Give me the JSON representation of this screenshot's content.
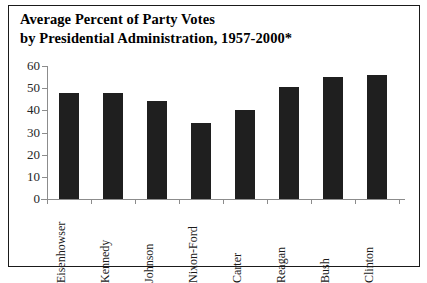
{
  "title": {
    "line1": "Average Percent of Party Votes",
    "line2": "by Presidential Administration, 1957-2000*"
  },
  "chart_data": {
    "type": "bar",
    "title": "Average Percent of Party Votes by Presidential Administration, 1957-2000*",
    "xlabel": "",
    "ylabel": "",
    "ylim": [
      0,
      60
    ],
    "yticks": [
      "0",
      "10",
      "20",
      "30",
      "40",
      "50",
      "60"
    ],
    "grid": false,
    "legend": "none",
    "categories": [
      "Eisenhowser",
      "Kennedy",
      "Johnson",
      "Nixon-Ford",
      "Carter",
      "Reagan",
      "Bush",
      "Clinton"
    ],
    "values": [
      48,
      48,
      44,
      34.5,
      40,
      50.5,
      55,
      56
    ],
    "bar_color": "#1f1f1f",
    "axis_color": "#8c8c8c",
    "border_color": "#1a1a1a"
  }
}
